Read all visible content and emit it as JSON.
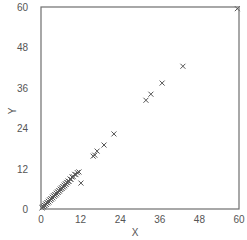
{
  "chart_data": {
    "type": "scatter",
    "title": "",
    "xlabel": "X",
    "ylabel": "Y",
    "xlim": [
      0,
      60
    ],
    "ylim": [
      0,
      60
    ],
    "xticks": [
      0,
      12,
      24,
      36,
      48,
      60
    ],
    "yticks": [
      0,
      12,
      24,
      36,
      48,
      60
    ],
    "grid": false,
    "legend": null,
    "marker": "x",
    "colors": {
      "marker": "#555555",
      "axis": "#6e6e6e",
      "text": "#555555"
    },
    "series": [
      {
        "name": "points",
        "points": [
          [
            0.3,
            0.3
          ],
          [
            0.5,
            0.6
          ],
          [
            0.8,
            0.7
          ],
          [
            1.0,
            1.1
          ],
          [
            1.2,
            1.0
          ],
          [
            1.4,
            1.5
          ],
          [
            1.6,
            1.4
          ],
          [
            1.8,
            1.9
          ],
          [
            2.0,
            1.8
          ],
          [
            2.2,
            2.3
          ],
          [
            2.4,
            2.1
          ],
          [
            2.6,
            2.7
          ],
          [
            2.8,
            2.6
          ],
          [
            3.0,
            3.1
          ],
          [
            3.2,
            2.9
          ],
          [
            3.4,
            3.5
          ],
          [
            3.6,
            3.3
          ],
          [
            3.8,
            3.9
          ],
          [
            4.0,
            3.8
          ],
          [
            4.2,
            4.3
          ],
          [
            4.4,
            4.1
          ],
          [
            4.6,
            4.7
          ],
          [
            4.8,
            4.5
          ],
          [
            5.0,
            5.1
          ],
          [
            5.2,
            4.9
          ],
          [
            5.4,
            5.5
          ],
          [
            5.6,
            5.3
          ],
          [
            5.8,
            5.9
          ],
          [
            6.0,
            5.8
          ],
          [
            6.2,
            6.3
          ],
          [
            6.4,
            6.1
          ],
          [
            6.6,
            6.7
          ],
          [
            6.8,
            6.5
          ],
          [
            7.0,
            7.1
          ],
          [
            7.2,
            6.9
          ],
          [
            7.4,
            7.5
          ],
          [
            7.6,
            7.3
          ],
          [
            7.8,
            7.9
          ],
          [
            8.0,
            7.8
          ],
          [
            8.2,
            8.3
          ],
          [
            8.5,
            8.2
          ],
          [
            8.8,
            8.9
          ],
          [
            9.1,
            8.8
          ],
          [
            9.4,
            9.5
          ],
          [
            9.8,
            9.6
          ],
          [
            10.2,
            10.3
          ],
          [
            10.6,
            10.2
          ],
          [
            11.0,
            10.8
          ],
          [
            11.5,
            11.0
          ],
          [
            12.1,
            7.7
          ],
          [
            15.8,
            15.7
          ],
          [
            16.3,
            16.0
          ],
          [
            17.0,
            17.2
          ],
          [
            19.1,
            19.0
          ],
          [
            22.1,
            22.3
          ],
          [
            31.8,
            32.3
          ],
          [
            33.3,
            34.1
          ],
          [
            36.7,
            37.4
          ],
          [
            43.0,
            42.4
          ],
          [
            59.5,
            59.5
          ]
        ]
      }
    ]
  }
}
